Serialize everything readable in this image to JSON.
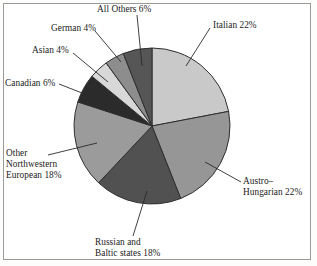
{
  "chart_data": {
    "type": "pie",
    "title": "",
    "subtitle": "",
    "xlabel": "",
    "ylabel": "",
    "legend_position": "none",
    "grid": false,
    "start_angle_deg": 0,
    "direction": "clockwise",
    "units": "percent",
    "total": 100,
    "categories": [
      "Italian",
      "Austro–Hungarian",
      "Russian and Baltic states",
      "Other Northwestern European",
      "Canadian",
      "Asian",
      "German",
      "All Others"
    ],
    "values": [
      22,
      22,
      18,
      18,
      6,
      4,
      4,
      6
    ],
    "slices": [
      {
        "key": "italian",
        "name": "Italian",
        "value": 22,
        "value_text": "22%",
        "color": "#c9c9c9",
        "label_lines": [
          "Italian 22%"
        ]
      },
      {
        "key": "austro-hungarian",
        "name": "Austro–Hungarian",
        "value": 22,
        "value_text": "22%",
        "color": "#969696",
        "label_lines": [
          "Austro–",
          "Hungarian 22%"
        ]
      },
      {
        "key": "russian-baltic",
        "name": "Russian and Baltic states",
        "value": 18,
        "value_text": "18%",
        "color": "#515151",
        "label_lines": [
          "Russian and",
          "Baltic states 18%"
        ]
      },
      {
        "key": "other-northwestern-european",
        "name": "Other Northwestern European",
        "value": 18,
        "value_text": "18%",
        "color": "#9b9b9b",
        "label_lines": [
          "Other",
          "Northwestern",
          "European 18%"
        ]
      },
      {
        "key": "canadian",
        "name": "Canadian",
        "value": 6,
        "value_text": "6%",
        "color": "#2b2b2b",
        "label_lines": [
          "Canadian 6%"
        ]
      },
      {
        "key": "asian",
        "name": "Asian",
        "value": 4,
        "value_text": "4%",
        "color": "#d8d8d8",
        "label_lines": [
          "Asian 4%"
        ]
      },
      {
        "key": "german",
        "name": "German",
        "value": 4,
        "value_text": "4%",
        "color": "#8d8d8d",
        "label_lines": [
          "German 4%"
        ]
      },
      {
        "key": "all-others",
        "name": "All Others",
        "value": 6,
        "value_text": "6%",
        "color": "#565656",
        "label_lines": [
          "All Others 6%"
        ]
      }
    ]
  },
  "figure": {
    "background_color": "#ffffff",
    "frame_color": "#9a9a9a",
    "text_color": "#1b1b1b",
    "slice_outline_color": "#2f2f2f",
    "leader_line_color": "#2b2b2b"
  },
  "geometry": {
    "center_x": 152,
    "center_y": 126,
    "radius": 78
  },
  "leaders": {
    "italian": {
      "x1": 210,
      "y1": 28,
      "x2": 186,
      "y2": 66
    },
    "austro": {
      "x1": 241,
      "y1": 182,
      "x2": 205,
      "y2": 162
    },
    "russian": {
      "x1": 133,
      "y1": 236,
      "x2": 147,
      "y2": 191
    },
    "onwe": {
      "x1": 48,
      "y1": 155,
      "x2": 97,
      "y2": 143
    },
    "canadian": {
      "x1": 59,
      "y1": 84,
      "x2": 100,
      "y2": 100
    },
    "asian": {
      "x1": 73,
      "y1": 53,
      "x2": 108,
      "y2": 82
    },
    "german": {
      "x1": 95,
      "y1": 31,
      "x2": 121,
      "y2": 62
    },
    "allothers": {
      "x1": 137,
      "y1": 15,
      "x2": 142,
      "y2": 66
    }
  }
}
